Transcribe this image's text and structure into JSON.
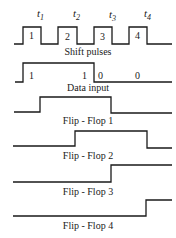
{
  "time_markers": [
    {
      "label": "t",
      "sub": "1"
    },
    {
      "label": "t",
      "sub": "2"
    },
    {
      "label": "t",
      "sub": "3"
    },
    {
      "label": "t",
      "sub": "4"
    }
  ],
  "signals": [
    {
      "name": "Shift pulses",
      "pulse_labels": [
        "1",
        "2",
        "3",
        "4"
      ]
    },
    {
      "name": "Data input",
      "bit_labels": [
        "1",
        "1",
        "0",
        "0"
      ]
    },
    {
      "name": "Flip - Flop  1"
    },
    {
      "name": "Flip - Flop  2"
    },
    {
      "name": "Flip - Flop  3"
    },
    {
      "name": "Flip - Flop  4"
    }
  ]
}
